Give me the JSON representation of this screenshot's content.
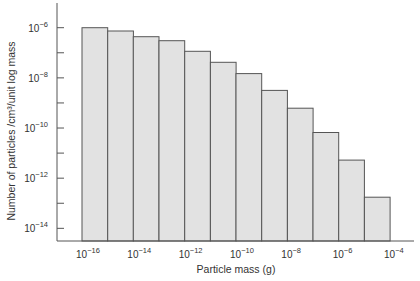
{
  "chart_data": {
    "type": "bar",
    "title": "",
    "xlabel": "Particle mass (g)",
    "ylabel": "Number of particles /cm³/unit log mass",
    "x_scale": "log",
    "y_scale": "log",
    "bin_edges_log10": [
      -16,
      -15,
      -14,
      -13,
      -12,
      -11,
      -10,
      -9,
      -8,
      -7,
      -6,
      -5,
      -4
    ],
    "categories": [
      "1e-16–1e-15",
      "1e-15–1e-14",
      "1e-14–1e-13",
      "1e-13–1e-12",
      "1e-12–1e-11",
      "1e-11–1e-10",
      "1e-10–1e-9",
      "1e-9–1e-8",
      "1e-8–1e-7",
      "1e-7–1e-6",
      "1e-6–1e-5",
      "1e-5–1e-4"
    ],
    "values": [
      1e-06,
      7.4e-07,
      4.4e-07,
      3e-07,
      1.1e-07,
      4.2e-08,
      1.5e-08,
      3.2e-09,
      6.2e-10,
      6.6e-11,
      5.2e-12,
      1.7e-13
    ],
    "values_log10": [
      -6.0,
      -6.13,
      -6.36,
      -6.52,
      -6.94,
      -7.38,
      -7.83,
      -8.5,
      -9.21,
      -10.18,
      -11.28,
      -12.76
    ],
    "ylim_log10": [
      -14.5,
      -5.0
    ],
    "xlim_log10": [
      -16.95,
      -3.1
    ],
    "x_ticks": [
      {
        "exp": -16,
        "label": "10",
        "sup": "−16"
      },
      {
        "exp": -14,
        "label": "10",
        "sup": "−14"
      },
      {
        "exp": -12,
        "label": "10",
        "sup": "−12"
      },
      {
        "exp": -10,
        "label": "10",
        "sup": "−10"
      },
      {
        "exp": -8,
        "label": "10",
        "sup": "−8"
      },
      {
        "exp": -6,
        "label": "10",
        "sup": "−6"
      },
      {
        "exp": -4,
        "label": "10",
        "sup": "−4"
      }
    ],
    "y_ticks": [
      {
        "exp": -6,
        "label": "10",
        "sup": "−6"
      },
      {
        "exp": -8,
        "label": "10",
        "sup": "−8"
      },
      {
        "exp": -10,
        "label": "10",
        "sup": "−10"
      },
      {
        "exp": -12,
        "label": "10",
        "sup": "−12"
      },
      {
        "exp": -14,
        "label": "10",
        "sup": "−14"
      }
    ],
    "y_minor_ticks": [
      -7,
      -9,
      -11,
      -13
    ],
    "grid": false,
    "legend": null,
    "colors": {
      "bar_fill": "#e2e2e2",
      "bar_stroke": "#555555",
      "axis": "#555555",
      "text": "#333333"
    }
  }
}
